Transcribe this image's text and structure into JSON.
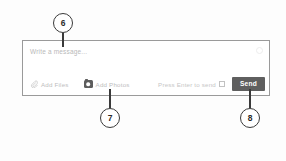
{
  "composer": {
    "message_input": {
      "value": "",
      "placeholder": "Write a message..."
    },
    "emoji_icon_name": "emoji-icon",
    "toolbar": {
      "add_files_label": "Add Files",
      "add_files_icon": "paperclip-icon",
      "add_photos_label": "Add Photos",
      "add_photos_icon": "camera-icon",
      "enter_hint_label": "Press Enter to send",
      "enter_hint_checked": false,
      "send_label": "Send"
    }
  },
  "callouts": [
    {
      "number": "6",
      "target": "message-input"
    },
    {
      "number": "7",
      "target": "add-photos-button"
    },
    {
      "number": "8",
      "target": "send-button"
    }
  ],
  "colors": {
    "send_button_bg": "#5f5f5f",
    "send_button_text": "#ffffff",
    "panel_border": "#9a9a9a",
    "placeholder_text": "#b9b9b9",
    "toolbar_text": "#bdbdbd",
    "callout_stroke": "#3a3a3a",
    "background": "#fdfdfd"
  }
}
